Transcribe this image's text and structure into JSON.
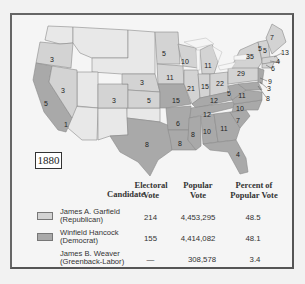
{
  "map": {
    "year": "1880",
    "colors": {
      "republican": "#d3d3d3",
      "democrat": "#a9a9a9",
      "territory": "#e8e8e8",
      "border": "#888888",
      "water": "#f5f5f5"
    },
    "state_labels": [
      {
        "value": "3",
        "x": 52,
        "y": 59
      },
      {
        "value": "3",
        "x": 63,
        "y": 90
      },
      {
        "value": "5",
        "x": 46,
        "y": 103
      },
      {
        "value": "1",
        "x": 66,
        "y": 124
      },
      {
        "value": "3",
        "x": 114,
        "y": 100
      },
      {
        "value": "3",
        "x": 142,
        "y": 82
      },
      {
        "value": "5",
        "x": 149,
        "y": 100
      },
      {
        "value": "5",
        "x": 164,
        "y": 53
      },
      {
        "value": "10",
        "x": 185,
        "y": 61
      },
      {
        "value": "11",
        "x": 208,
        "y": 65
      },
      {
        "value": "11",
        "x": 170,
        "y": 77
      },
      {
        "value": "21",
        "x": 191,
        "y": 88
      },
      {
        "value": "15",
        "x": 205,
        "y": 86
      },
      {
        "value": "22",
        "x": 220,
        "y": 83
      },
      {
        "value": "15",
        "x": 176,
        "y": 100
      },
      {
        "value": "12",
        "x": 214,
        "y": 100
      },
      {
        "value": "5",
        "x": 229,
        "y": 93
      },
      {
        "value": "11",
        "x": 242,
        "y": 95
      },
      {
        "value": "12",
        "x": 207,
        "y": 114
      },
      {
        "value": "10",
        "x": 240,
        "y": 108
      },
      {
        "value": "7",
        "x": 238,
        "y": 120
      },
      {
        "value": "6",
        "x": 178,
        "y": 123
      },
      {
        "value": "8",
        "x": 193,
        "y": 134
      },
      {
        "value": "10",
        "x": 207,
        "y": 131
      },
      {
        "value": "11",
        "x": 224,
        "y": 128
      },
      {
        "value": "8",
        "x": 180,
        "y": 143
      },
      {
        "value": "8",
        "x": 147,
        "y": 144
      },
      {
        "value": "4",
        "x": 238,
        "y": 154
      },
      {
        "value": "29",
        "x": 241,
        "y": 73
      },
      {
        "value": "35",
        "x": 250,
        "y": 56
      },
      {
        "value": "7",
        "x": 272,
        "y": 37
      },
      {
        "value": "5",
        "x": 260,
        "y": 48
      },
      {
        "value": "5",
        "x": 265,
        "y": 50
      },
      {
        "value": "13",
        "x": 285,
        "y": 52
      },
      {
        "value": "4",
        "x": 278,
        "y": 61
      },
      {
        "value": "6",
        "x": 273,
        "y": 68
      },
      {
        "value": "9",
        "x": 270,
        "y": 81
      },
      {
        "value": "3",
        "x": 269,
        "y": 88
      },
      {
        "value": "8",
        "x": 268,
        "y": 98
      }
    ]
  },
  "table": {
    "headers": {
      "candidate": "Candidate",
      "electoral_1": "Electoral",
      "electoral_2": "Vote",
      "popular_1": "Popular",
      "popular_2": "Vote",
      "percent_1": "Percent of",
      "percent_2": "Popular Vote"
    },
    "rows": [
      {
        "name": "James A. Garfield",
        "party": "(Republican)",
        "electoral": "214",
        "popular": "4,453,295",
        "percent": "48.5",
        "swatch": "#d3d3d3"
      },
      {
        "name": "Winfield Hancock",
        "party": "(Democrat)",
        "electoral": "155",
        "popular": "4,414,082",
        "percent": "48.1",
        "swatch": "#a9a9a9"
      },
      {
        "name": "James B. Weaver",
        "party": "(Greenback-Labor)",
        "electoral": "—",
        "popular": "308,578",
        "percent": "3.4",
        "swatch": ""
      }
    ]
  }
}
